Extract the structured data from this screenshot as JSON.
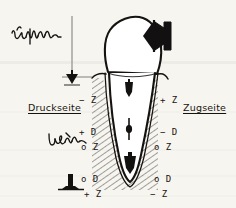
{
  "figure": {
    "background_color": "#f7f5f0",
    "ink_color": "#15120f",
    "guide_color": "#9a9a96"
  },
  "labels": {
    "pressure_side": "Druckseite",
    "tension_side": "Zugseite"
  },
  "handwriting": {
    "top_left": "Umform",
    "mid_left": "Lasten"
  },
  "sign_groups": {
    "upper_left": {
      "z": "− Z",
      "d": "+ D"
    },
    "upper_right": {
      "z": "+ Z",
      "d": "− D"
    },
    "middle_left": {
      "z": "o Z",
      "d": "o D"
    },
    "middle_right": {
      "z": "o Z",
      "d": "o D"
    },
    "lower_left": {
      "z": "+ Z",
      "d": "− D"
    },
    "lower_right": {
      "z": "− Z",
      "d": "+ D"
    }
  },
  "icons": {
    "force_arrow_crown": "arrow-left-icon",
    "guide_arrow_top": "arrow-down-icon",
    "root_arrow_upper": "arrow-down-icon",
    "root_center_marker": "rotation-center-icon",
    "root_arrow_apex": "arrow-down-icon",
    "legend_marker": "nail-marker-icon"
  }
}
